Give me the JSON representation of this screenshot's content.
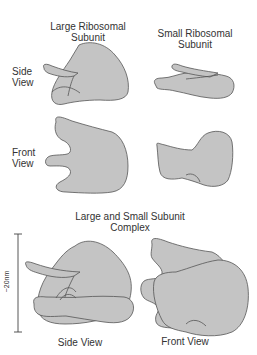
{
  "title_large": [
    "Large Ribosomal",
    "Subunit"
  ],
  "title_small": [
    "Small Ribosomal",
    "Subunit"
  ],
  "row_labels": {
    "side": [
      "Side",
      "View"
    ],
    "front": [
      "Front",
      "View"
    ]
  },
  "complex_title": [
    "Large and Small Subunit",
    "Complex"
  ],
  "scale_bar": {
    "label": "~20nm"
  },
  "complex_views": {
    "side": "Side View",
    "front": "Front View"
  },
  "colors": {
    "shape_fill": "#c4c4c4",
    "shape_stroke": "#555555",
    "text": "#333333",
    "background": "#ffffff"
  }
}
